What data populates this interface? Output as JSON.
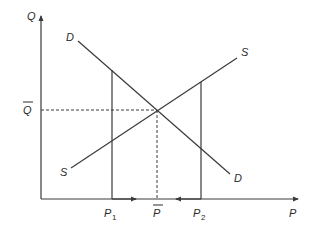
{
  "diagram": {
    "type": "supply-demand",
    "axes": {
      "y_label": "Q",
      "x_label": "P"
    },
    "curves": [
      {
        "name": "demand",
        "label_start": "D",
        "label_end": "D"
      },
      {
        "name": "supply",
        "label_start": "S",
        "label_end": "S"
      }
    ],
    "equilibrium": {
      "quantity_label": "Q",
      "price_label": "P"
    },
    "price_levels": [
      {
        "label": "P",
        "subscript": "1"
      },
      {
        "label": "P",
        "subscript": "2"
      }
    ],
    "colors": {
      "line": "#3a3a3a",
      "text": "#2a2a2a",
      "background": "#ffffff"
    }
  }
}
